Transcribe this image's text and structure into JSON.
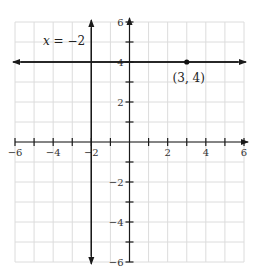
{
  "chart_data": {
    "type": "line",
    "title": "",
    "xlabel": "",
    "ylabel": "",
    "xlim": [
      -6,
      6
    ],
    "ylim": [
      -6,
      6
    ],
    "grid": true,
    "x_ticks": [
      -6,
      -5,
      -4,
      -3,
      -2,
      -1,
      0,
      1,
      2,
      3,
      4,
      5,
      6
    ],
    "x_tick_labels": [
      "−6",
      "−4",
      "−2",
      "2",
      "4",
      "6"
    ],
    "x_tick_label_values": [
      -6,
      -4,
      -2,
      2,
      4,
      6
    ],
    "y_ticks": [
      -6,
      -5,
      -4,
      -3,
      -2,
      -1,
      0,
      1,
      2,
      3,
      4,
      5,
      6
    ],
    "y_tick_labels": [
      "6",
      "4",
      "2",
      "−2",
      "−4",
      "−6"
    ],
    "y_tick_label_values": [
      6,
      4,
      2,
      -2,
      -4,
      -6
    ],
    "series": [
      {
        "name": "x = −2",
        "kind": "vertical-line",
        "x": -2,
        "arrows": "both"
      },
      {
        "name": "y = 4",
        "kind": "horizontal-line",
        "y": 4,
        "arrows": "both"
      }
    ],
    "points": [
      {
        "x": 3,
        "y": 4,
        "label": "(3, 4)"
      }
    ],
    "annotations": [
      {
        "text": "x = −2",
        "x": -3.5,
        "y": 5
      },
      {
        "text": "(3, 4)",
        "x": 3,
        "y": 3.4
      }
    ]
  },
  "labels": {
    "vertical_line": "x = −2",
    "point": "(3, 4)"
  }
}
